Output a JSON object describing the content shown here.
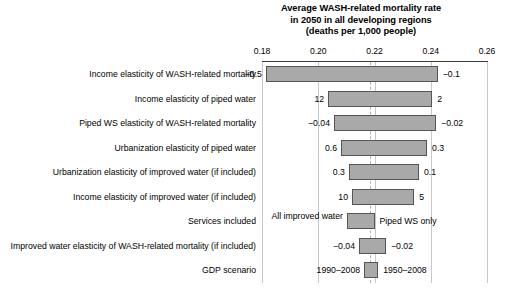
{
  "chart_data": {
    "type": "bar",
    "subtype": "tornado-sensitivity",
    "title": "Average WASH-related mortality rate in 2050 in all developing regions (deaths per 1,000 people)",
    "title_lines": [
      "Average WASH-related mortality rate",
      "in 2050 in all developing regions",
      "(deaths per 1,000 people)"
    ],
    "xlabel": "",
    "ylabel": "",
    "xlim": [
      0.17,
      0.268
    ],
    "xticks": [
      0.18,
      0.2,
      0.22,
      0.24,
      0.26
    ],
    "xtick_labels": [
      "0.18",
      "0.20",
      "0.22",
      "0.24",
      "0.26"
    ],
    "grid": true,
    "baseline": 0.22,
    "legend": "none",
    "categories": [
      "Income elasticity of WASH-related mortality",
      "Income elasticity of piped water",
      "Piped WS elasticity of WASH-related mortality",
      "Urbanization elasticity of piped water",
      "Urbanization elasticity of improved water (if included)",
      "Income elasticity of improved water (if included)",
      "Services included",
      "Improved water elasticity of WASH-related mortality (if included)",
      "GDP scenario"
    ],
    "bars": [
      {
        "category": "Income elasticity of WASH-related mortality",
        "low": 0.1814,
        "high": 0.2425,
        "low_label": "−0.5",
        "high_label": "−0.1"
      },
      {
        "category": "Income elasticity of piped water",
        "low": 0.2035,
        "high": 0.2405,
        "low_label": "12",
        "high_label": "2"
      },
      {
        "category": "Piped WS elasticity of WASH-related mortality",
        "low": 0.2056,
        "high": 0.2419,
        "low_label": "−0.04",
        "high_label": "−0.02"
      },
      {
        "category": "Urbanization elasticity of piped water",
        "low": 0.2081,
        "high": 0.2387,
        "low_label": "0.6",
        "high_label": "0.3"
      },
      {
        "category": "Urbanization elasticity of improved water (if included)",
        "low": 0.2109,
        "high": 0.2358,
        "low_label": "0.3",
        "high_label": "0.1"
      },
      {
        "category": "Income elasticity of improved water (if included)",
        "low": 0.212,
        "high": 0.2341,
        "low_label": "10",
        "high_label": "5"
      },
      {
        "category": "Services included",
        "low": 0.2102,
        "high": 0.22,
        "low_label": "All improved water",
        "high_label": "Piped WS only"
      },
      {
        "category": "Improved water elasticity of WASH-related mortality (if included)",
        "low": 0.2145,
        "high": 0.2241,
        "low_label": "−0.04",
        "high_label": "−0.02"
      },
      {
        "category": "GDP scenario",
        "low": 0.2163,
        "high": 0.2213,
        "low_label": "1990–2008",
        "high_label": "1950–2008"
      }
    ],
    "colors": {
      "bar_fill": "#a9a9a9",
      "bar_edge": "#555555",
      "axis": "#3a3a3a",
      "gridline": "#c8c8c8",
      "centerline": "#b4b4b4",
      "text": "#000000",
      "background": "#ffffff"
    }
  },
  "layout": {
    "plot_left_px": 262,
    "plot_right_px": 487,
    "plot_top_px": 62,
    "row_height_px": 24.5,
    "bar_height_px": 16,
    "center_px": 370
  }
}
